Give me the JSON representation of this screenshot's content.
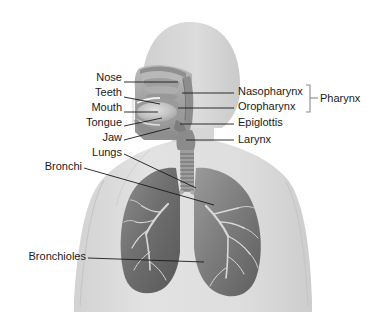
{
  "diagram": {
    "view": "anterior torso with sagittal head section",
    "palette": {
      "background": "#ffffff",
      "body_silhouette": "#d8d8d8",
      "body_silhouette_light": "#e4e4e4",
      "head_fill": "#d5d5d5",
      "lung_dark": "#6e6e6e",
      "lung_mid": "#8d8d8d",
      "lung_light": "#b5b5b5",
      "airway_tree": "#dcdcdc",
      "trachea": "#9a9a9a",
      "cavity_tissue": "#a9a9a9",
      "tongue": "#c6c6c6",
      "leader_line": "#1a1a1a",
      "bracket": "#8a8a8a",
      "text": "#1a1a1a"
    }
  },
  "labels_left": [
    {
      "id": "nose",
      "text": "Nose",
      "x": 78,
      "y": 77,
      "width": 44,
      "leader": {
        "x1": 124,
        "y1": 82,
        "x2": 178,
        "y2": 82
      }
    },
    {
      "id": "teeth",
      "text": "Teeth",
      "x": 76,
      "y": 92,
      "width": 46,
      "leader": {
        "x1": 124,
        "y1": 97,
        "x2": 160,
        "y2": 104
      }
    },
    {
      "id": "mouth",
      "text": "Mouth",
      "x": 70,
      "y": 107,
      "width": 52,
      "leader": {
        "x1": 124,
        "y1": 112,
        "x2": 158,
        "y2": 112
      }
    },
    {
      "id": "tongue",
      "text": "Tongue",
      "x": 66,
      "y": 122,
      "width": 56,
      "leader": {
        "x1": 124,
        "y1": 126,
        "x2": 162,
        "y2": 118
      }
    },
    {
      "id": "jaw",
      "text": "Jaw",
      "x": 86,
      "y": 136,
      "width": 36,
      "leader": {
        "x1": 124,
        "y1": 140,
        "x2": 170,
        "y2": 128
      }
    },
    {
      "id": "lungs",
      "text": "Lungs",
      "x": 72,
      "y": 150,
      "width": 50,
      "leader": {
        "x1": 124,
        "y1": 154,
        "x2": 196,
        "y2": 188
      }
    },
    {
      "id": "bronchi",
      "text": "Bronchi",
      "x": 33,
      "y": 164,
      "width": 48,
      "leader": {
        "x1": 84,
        "y1": 168,
        "x2": 214,
        "y2": 205
      }
    },
    {
      "id": "bronchioles",
      "text": "Bronchioles",
      "x": 12,
      "y": 254,
      "width": 72,
      "leader": {
        "x1": 88,
        "y1": 258,
        "x2": 204,
        "y2": 262
      }
    }
  ],
  "labels_right": [
    {
      "id": "nasopharynx",
      "text": "Nasopharynx",
      "x": 238,
      "y": 88,
      "leader": {
        "x1": 182,
        "y1": 93,
        "x2": 234,
        "y2": 93
      }
    },
    {
      "id": "oropharynx",
      "text": "Oropharynx",
      "x": 238,
      "y": 103,
      "leader": {
        "x1": 178,
        "y1": 108,
        "x2": 234,
        "y2": 108
      }
    },
    {
      "id": "epiglottis",
      "text": "Epiglottis",
      "x": 238,
      "y": 119,
      "leader": {
        "x1": 180,
        "y1": 124,
        "x2": 234,
        "y2": 124
      }
    },
    {
      "id": "larynx",
      "text": "Larynx",
      "x": 238,
      "y": 136,
      "leader": {
        "x1": 186,
        "y1": 140,
        "x2": 234,
        "y2": 140
      }
    }
  ],
  "bracket_group": {
    "id": "pharynx",
    "text": "Pharynx",
    "text_x": 328,
    "text_y": 96,
    "members": [
      "nasopharynx",
      "oropharynx"
    ],
    "bracket": {
      "x": 310,
      "y_top": 86,
      "y_bottom": 112,
      "tip_x": 318,
      "tip_y": 99
    }
  },
  "structures": [
    {
      "id": "head",
      "name": "head-silhouette"
    },
    {
      "id": "neck",
      "name": "neck-silhouette"
    },
    {
      "id": "torso",
      "name": "torso-silhouette"
    },
    {
      "id": "nasal-cavity",
      "name": "nasal-cavity"
    },
    {
      "id": "oral-cavity",
      "name": "oral-cavity"
    },
    {
      "id": "tongue",
      "name": "tongue"
    },
    {
      "id": "pharynx",
      "name": "pharynx-passage"
    },
    {
      "id": "larynx",
      "name": "larynx"
    },
    {
      "id": "trachea",
      "name": "trachea-with-cartilage-rings"
    },
    {
      "id": "lung-left",
      "name": "lung-left"
    },
    {
      "id": "lung-right",
      "name": "lung-right"
    },
    {
      "id": "bronchial-tree",
      "name": "bronchial-tree"
    }
  ]
}
